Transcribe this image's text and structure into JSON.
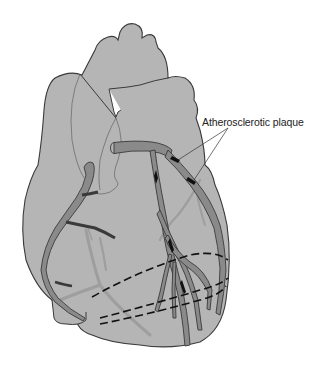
{
  "diagram": {
    "labels": [
      {
        "id": "plaque",
        "text": "Atherosclerotic plaque"
      }
    ],
    "colors": {
      "heart_fill": "#b5b5b5",
      "outline": "#3a3a3a",
      "artery_fill": "#8a8a8a",
      "posterior_vessel": "#a0a0a0",
      "plaque": "#111111",
      "background": "#ffffff"
    }
  }
}
